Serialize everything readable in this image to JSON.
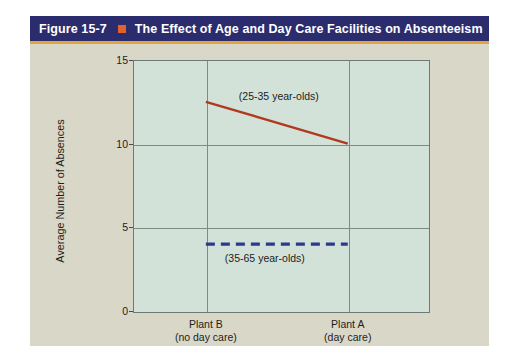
{
  "figure": {
    "number": "Figure 15-7",
    "separator_icon": "orange-square-icon",
    "title": "The Effect of Age and Day Care Facilities on Absenteeism",
    "title_bar_color": "#2b2c6e",
    "accent_color": "#e0a53c",
    "separator_color": "#e2622a",
    "card_color": "#d9d7c8"
  },
  "chart_data": {
    "type": "line",
    "title": "The Effect of Age and Day Care Facilities on Absenteeism",
    "xlabel": "",
    "ylabel": "Average Number of Absences",
    "categories": [
      "Plant B",
      "Plant A"
    ],
    "category_sublabels": [
      "(no day care)",
      "(day care)"
    ],
    "x": [
      0,
      1
    ],
    "ylim": [
      0,
      15
    ],
    "yticks": [
      0,
      5,
      10,
      15
    ],
    "ytick_labels": [
      "0",
      "5",
      "10",
      "15"
    ],
    "grid": true,
    "legend_position": "inline-annotations",
    "plot_background": "#d3e2d8",
    "series": [
      {
        "name": "(25-35 year-olds)",
        "values": [
          12.5,
          10
        ],
        "color": "#b03a20",
        "style": "solid",
        "annotation": "(25-35 year-olds)"
      },
      {
        "name": "(35-65 year-olds)",
        "values": [
          4,
          4
        ],
        "color": "#2b3a8c",
        "style": "dashed",
        "annotation": "(35-65 year-olds)"
      }
    ]
  }
}
